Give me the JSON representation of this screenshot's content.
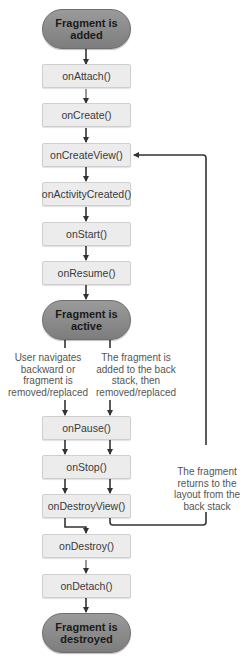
{
  "diagram": {
    "states": {
      "added": "Fragment is added",
      "active": "Fragment is active",
      "destroyed": "Fragment is destroyed"
    },
    "callbacks": [
      "onAttach()",
      "onCreate()",
      "onCreateView()",
      "onActivityCreated()",
      "onStart()",
      "onResume()",
      "onPause()",
      "onStop()",
      "onDestroyView()",
      "onDestroy()",
      "onDetach()"
    ],
    "notes": {
      "left_branch": "User navigates backward or fragment is removed/replaced",
      "right_branch": "The fragment is added to the back stack, then removed/replaced",
      "return_loop": "The fragment returns to the layout from the back stack"
    },
    "colors": {
      "state_fill": "#8a8a8a",
      "callback_fill": "#ececec",
      "arrow": "#333333"
    }
  }
}
